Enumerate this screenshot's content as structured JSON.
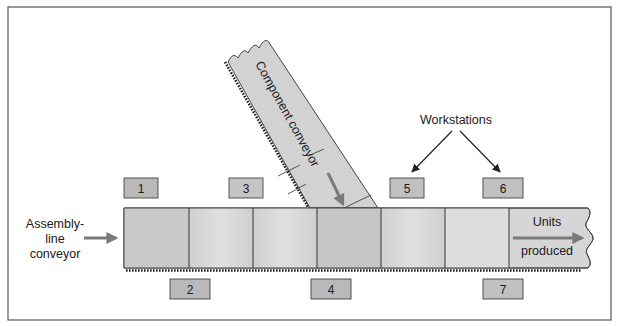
{
  "diagram": {
    "colors": {
      "frame": "#555555",
      "conveyor_fill": "#d4d4d4",
      "conveyor_dark": "#c4c4c4",
      "station_fill": "#b9b9b9",
      "stroke": "#333333",
      "flow_arrow": "#7a7a7a",
      "belt": "#222222"
    },
    "labels": {
      "assembly_line": [
        "Assembly-",
        "line",
        "conveyor"
      ],
      "component_conveyor": "Component conveyor",
      "workstations": "Workstations",
      "units_produced": [
        "Units",
        "produced"
      ]
    },
    "workstations": [
      {
        "id": "1",
        "position": "top"
      },
      {
        "id": "2",
        "position": "bottom"
      },
      {
        "id": "3",
        "position": "top"
      },
      {
        "id": "4",
        "position": "bottom"
      },
      {
        "id": "5",
        "position": "top"
      },
      {
        "id": "6",
        "position": "top"
      },
      {
        "id": "7",
        "position": "bottom"
      }
    ],
    "conveyor_segments": 7
  }
}
